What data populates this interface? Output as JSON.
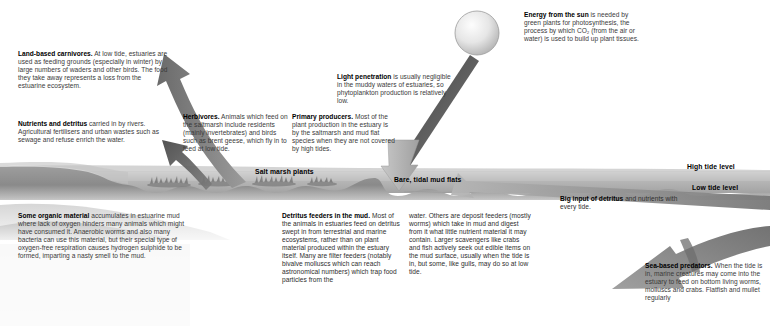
{
  "diagram": {
    "colors": {
      "sky": "#ffffff",
      "land_upper": "#c9c9c9",
      "water_band": "#b0b0b0",
      "mud_lower": "#8f8f8f",
      "deep_sea": "#6e6e6e",
      "arrow_dark": "#4a4a4a",
      "arrow_mid": "#7b7b7b",
      "arrow_light": "#b9b9b9",
      "sun_fill": "#e8e8e8",
      "text": "#2e2e2e",
      "heading": "#000000"
    }
  },
  "notes": {
    "carnivores": {
      "heading": "Land-based carnivores.",
      "body": " At low tide, estuaries are used as feeding grounds (especially in winter) by large numbers of waders and other birds. The food they take away represents a loss from the estuarine ecosystem."
    },
    "nutrients": {
      "heading": "Nutrients and detritus",
      "body": " carried in by rivers. Agricultural fertilisers and urban wastes such as sewage and refuse enrich the water."
    },
    "herbivores": {
      "heading": "Herbivores.",
      "body": " Animals which feed on the saltmarsh include residents (mainly invertebrates) and birds such as brent geese, which fly in to feed at low tide."
    },
    "primary_producers": {
      "heading": "Primary producers.",
      "body": " Most of the plant production in the estuary is by the saltmarsh and mud flat species when they are not covered by high tides."
    },
    "light_penetration": {
      "heading": "Light penetration",
      "body": " is usually negligible in the muddy waters of estuaries, so phytoplankton production is relatively low."
    },
    "energy_from_sun": {
      "heading": "Energy from the sun",
      "body": " is needed by green plants for photosynthesis, the process by which CO₂ (from the air or water) is used to build up plant tissues."
    },
    "organic_material": {
      "heading": "Some organic material",
      "body": " accumulates in estuarine mud where lack of oxygen hinders many animals which might have consumed it. Anaerobic worms and also many bacteria can use this material, but their special type of oxygen-free respiration causes hydrogen sulphide to be formed, imparting a nasty smell to the mud."
    },
    "detritus_feeders_col1": {
      "heading": "Detritus feeders in the mud.",
      "body": " Most of the animals in estuaries feed on detritus swept in from terrestrial and marine ecosystems, rather than on plant material produced within the estuary itself. Many are filter feeders (notably bivalve molluscs which can reach astronomical numbers) which trap food particles from the"
    },
    "detritus_feeders_col2": {
      "heading": "",
      "body": "water. Others are deposit feeders (mostly worms) which take in mud and digest from it what little nutrient material it may contain. Larger scavengers like crabs and fish actively seek out edible items on the mud surface, usually when the tide is in, but some, like gulls, may do so at low tide."
    },
    "big_input": {
      "heading": "Big input of detritus",
      "body": " and nutrients with every tide."
    },
    "sea_predators": {
      "heading": "Sea-based predators.",
      "body": " When the tide is in, marine creatures may come into the estuary to feed on bottom living worms, molluscs and crabs. Flatfish and mullet regularly"
    }
  },
  "labels": {
    "salt_marsh": "Salt marsh plants",
    "mud_flats": "Bare, tidal mud flats",
    "high_tide": "High tide level",
    "low_tide": "Low tide level"
  },
  "icons": {
    "sun": "sun-icon",
    "arrow_up_left": "arrow-up-left-icon",
    "arrow_down_left": "arrow-down-left-icon",
    "arrow_sun_ray": "arrow-diagonal-ray-icon",
    "arrow_down_mud": "arrow-down-icon",
    "arrow_tide_in": "arrow-left-icon",
    "arrow_predator": "arrow-down-left-large-icon"
  }
}
